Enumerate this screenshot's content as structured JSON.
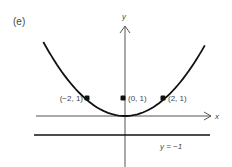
{
  "panel_label": "(e)",
  "axes": {
    "x_label": "x",
    "y_label": "y"
  },
  "curve": {
    "equation": "y = x^2/4",
    "x_range": [
      -4.3,
      4.2
    ]
  },
  "directrix": {
    "y": -1,
    "label": "y = −1"
  },
  "points": [
    {
      "x": -2,
      "y": 1,
      "label": "(−2, 1)",
      "label_side": "left"
    },
    {
      "x": 0,
      "y": 1,
      "label": "(0, 1)",
      "label_side": "right"
    },
    {
      "x": 2,
      "y": 1,
      "label": "(2, 1)",
      "label_side": "right"
    }
  ],
  "colors": {
    "ink": "#111111",
    "axis": "#555555",
    "text": "#444444"
  }
}
